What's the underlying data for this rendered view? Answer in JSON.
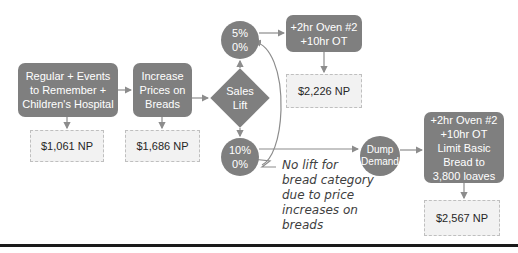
{
  "diagram": {
    "nodes": {
      "start": {
        "label": "Regular + Events to Remember + Children's Hospital"
      },
      "increase": {
        "label": "Increase Prices on Breads"
      },
      "decision": {
        "label": "Sales Lift"
      },
      "lift5": {
        "label": "5%\n0%"
      },
      "lift10": {
        "label": "10%\n0%"
      },
      "oven1": {
        "label": "+2hr Oven #2\n+10hr OT"
      },
      "dump": {
        "label": "Dump Demand"
      },
      "oven2": {
        "label": "+2hr Oven #2\n+10hr OT\nLimit Basic Bread to\n3,800 loaves"
      }
    },
    "results": {
      "start_np": "$1,061 NP",
      "increase_np": "$1,686 NP",
      "oven1_np": "$2,226 NP",
      "oven2_np": "$2,567 NP"
    },
    "annotation": "No lift for\nbread category\ndue to price\nincreases on\nbreads",
    "colors": {
      "node_fill": "#7f7f7f",
      "node_text": "#ffffff",
      "result_fill": "#f2f2f2",
      "result_border": "#bfbfbf",
      "connector": "#8c8c8c"
    }
  }
}
